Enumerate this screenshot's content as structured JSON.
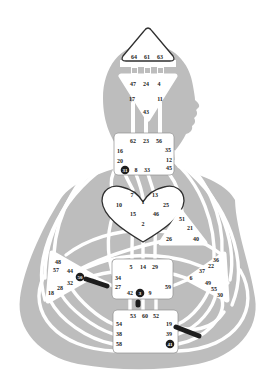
{
  "figure": {
    "name": "human-design-bodygraph"
  },
  "colors": {
    "background": "#ffffff",
    "silhouette": "#bdbdbd",
    "channel": "#ffffff",
    "center_fill": "#ffffff",
    "center_outline": "#2f2f2f",
    "square_outline": "#8f8f8f",
    "gate_text": "#1d1d1d",
    "highlight_fill": "#1d1d1d",
    "highlight_text": "#ffffff"
  },
  "chart_data": {
    "type": "bodygraph-diagram",
    "centers": [
      {
        "name": "head",
        "shape": "triangle-up",
        "gates": [
          {
            "num": "64",
            "x": 134,
            "y": 57
          },
          {
            "num": "61",
            "x": 147,
            "y": 57
          },
          {
            "num": "63",
            "x": 160,
            "y": 57
          }
        ]
      },
      {
        "name": "ajna",
        "shape": "triangle-down",
        "gates": [
          {
            "num": "47",
            "x": 133,
            "y": 84
          },
          {
            "num": "24",
            "x": 146,
            "y": 84
          },
          {
            "num": "4",
            "x": 159,
            "y": 84
          },
          {
            "num": "17",
            "x": 132,
            "y": 99
          },
          {
            "num": "11",
            "x": 160,
            "y": 99
          },
          {
            "num": "43",
            "x": 146,
            "y": 112
          }
        ]
      },
      {
        "name": "throat",
        "shape": "square",
        "gates": [
          {
            "num": "62",
            "x": 133,
            "y": 141
          },
          {
            "num": "23",
            "x": 146,
            "y": 141
          },
          {
            "num": "56",
            "x": 159,
            "y": 141
          },
          {
            "num": "16",
            "x": 120,
            "y": 151
          },
          {
            "num": "35",
            "x": 168,
            "y": 150
          },
          {
            "num": "20",
            "x": 120,
            "y": 161
          },
          {
            "num": "12",
            "x": 169,
            "y": 160
          },
          {
            "num": "31",
            "x": 125,
            "y": 170,
            "highlight": true
          },
          {
            "num": "8",
            "x": 136,
            "y": 170
          },
          {
            "num": "33",
            "x": 147,
            "y": 170
          },
          {
            "num": "45",
            "x": 169,
            "y": 168
          }
        ]
      },
      {
        "name": "g-center",
        "shape": "heart",
        "gates": [
          {
            "num": "7",
            "x": 132,
            "y": 195
          },
          {
            "num": "13",
            "x": 155,
            "y": 195
          },
          {
            "num": "1",
            "x": 143,
            "y": 202
          },
          {
            "num": "10",
            "x": 119,
            "y": 205
          },
          {
            "num": "25",
            "x": 166,
            "y": 205
          },
          {
            "num": "15",
            "x": 133,
            "y": 214
          },
          {
            "num": "46",
            "x": 156,
            "y": 214
          },
          {
            "num": "2",
            "x": 143,
            "y": 224
          }
        ]
      },
      {
        "name": "ego",
        "shape": "triangle",
        "gates": [
          {
            "num": "51",
            "x": 182,
            "y": 219
          },
          {
            "num": "21",
            "x": 190,
            "y": 228
          },
          {
            "num": "26",
            "x": 169,
            "y": 239
          },
          {
            "num": "40",
            "x": 196,
            "y": 239
          }
        ]
      },
      {
        "name": "spleen",
        "shape": "triangle-right",
        "gates": [
          {
            "num": "48",
            "x": 58,
            "y": 262
          },
          {
            "num": "57",
            "x": 56,
            "y": 270
          },
          {
            "num": "44",
            "x": 70,
            "y": 271
          },
          {
            "num": "50",
            "x": 80,
            "y": 277,
            "highlight": true
          },
          {
            "num": "32",
            "x": 70,
            "y": 283
          },
          {
            "num": "28",
            "x": 60,
            "y": 288
          },
          {
            "num": "18",
            "x": 51,
            "y": 293
          }
        ]
      },
      {
        "name": "solar-plexus",
        "shape": "triangle-left",
        "gates": [
          {
            "num": "36",
            "x": 216,
            "y": 260
          },
          {
            "num": "22",
            "x": 211,
            "y": 266
          },
          {
            "num": "37",
            "x": 202,
            "y": 271
          },
          {
            "num": "6",
            "x": 191,
            "y": 278
          },
          {
            "num": "49",
            "x": 208,
            "y": 283
          },
          {
            "num": "55",
            "x": 214,
            "y": 289
          },
          {
            "num": "30",
            "x": 220,
            "y": 295
          }
        ]
      },
      {
        "name": "sacral",
        "shape": "square",
        "gates": [
          {
            "num": "5",
            "x": 131,
            "y": 267
          },
          {
            "num": "14",
            "x": 143,
            "y": 267
          },
          {
            "num": "29",
            "x": 155,
            "y": 267
          },
          {
            "num": "34",
            "x": 118,
            "y": 278
          },
          {
            "num": "27",
            "x": 118,
            "y": 287
          },
          {
            "num": "59",
            "x": 168,
            "y": 287
          },
          {
            "num": "42",
            "x": 130,
            "y": 293
          },
          {
            "num": "3",
            "x": 140,
            "y": 293,
            "highlight": true
          },
          {
            "num": "9",
            "x": 150,
            "y": 293
          }
        ]
      },
      {
        "name": "root",
        "shape": "square",
        "gates": [
          {
            "num": "53",
            "x": 133,
            "y": 316
          },
          {
            "num": "60",
            "x": 145,
            "y": 316
          },
          {
            "num": "52",
            "x": 156,
            "y": 316
          },
          {
            "num": "54",
            "x": 119,
            "y": 324
          },
          {
            "num": "19",
            "x": 169,
            "y": 324
          },
          {
            "num": "38",
            "x": 119,
            "y": 334
          },
          {
            "num": "39",
            "x": 169,
            "y": 334
          },
          {
            "num": "58",
            "x": 119,
            "y": 344
          },
          {
            "num": "41",
            "x": 170,
            "y": 344,
            "highlight": true
          }
        ]
      }
    ],
    "highlighted_gates": [
      "31",
      "50",
      "3",
      "41"
    ],
    "highlighted_bars": [
      {
        "x1": 86,
        "y1": 279,
        "x2": 107,
        "y2": 286
      },
      {
        "x1": 138,
        "y1": 302,
        "x2": 138,
        "y2": 305
      },
      {
        "x1": 176,
        "y1": 327,
        "x2": 199,
        "y2": 336
      }
    ]
  }
}
